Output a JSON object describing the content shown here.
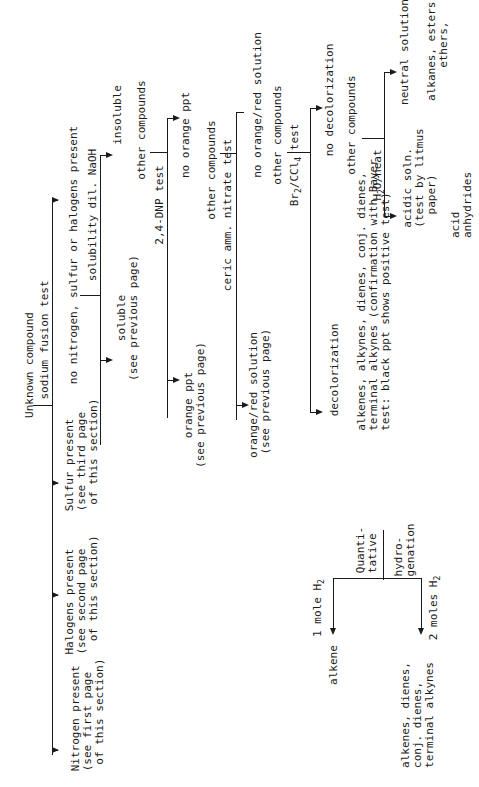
{
  "diagram": {
    "title": "Unknown compound",
    "nodes": {
      "unknown": "Unknown compound",
      "sodium_fusion": "sodium fusion test",
      "no_nsx": "no nitrogen, sulfur or halogens present",
      "sulfur": "Sulfur present\n(see third page\n of this section)",
      "halogens": "Halogens present\n(see second page\n  of this section)",
      "nitrogen": "Nitrogen present\n(see first page\n of this section)",
      "solubility": "solubility dil. NaOH",
      "insoluble": "insoluble",
      "soluble": "soluble\n(see previous page)",
      "other1": "other compounds",
      "dnp": "2,4-DNP test",
      "no_orange_ppt": "no orange ppt",
      "orange_ppt": "orange ppt\n(see previous page)",
      "other2": "other compounds",
      "ceric": "ceric amm. nitrate test",
      "no_orange_red": "no orange/red solution",
      "orange_red": "orange/red solution\n (see previous page)",
      "other3": "other compounds",
      "br2": "Br2/CCl4 test",
      "no_decol": "no decolorization",
      "decol": "decolorization",
      "other4": "other compounds",
      "h2o_heat": "H2O/heat",
      "neutral": "neutral solution",
      "alkanes": "alkanes, esters,\n     ethers,",
      "acidic": "acidic soln.\n(test by litmus\n  paper)",
      "anhydrides": "acid\nanhydrides",
      "unsat": "alkenes, alkynes, dienes, conj. dienes,\nterminal alkynes (confirmation with Bayer\ntest: black ppt shows positive test)",
      "quant": "Quanti-\ntative",
      "hydro": "hydro-\ngenation",
      "one_mole": "1 mole H2",
      "two_moles": "2 moles H2",
      "alkene": "alkene",
      "multi": "alkenes, dienes,\nconj. dienes,\nterminal alkynes"
    }
  }
}
